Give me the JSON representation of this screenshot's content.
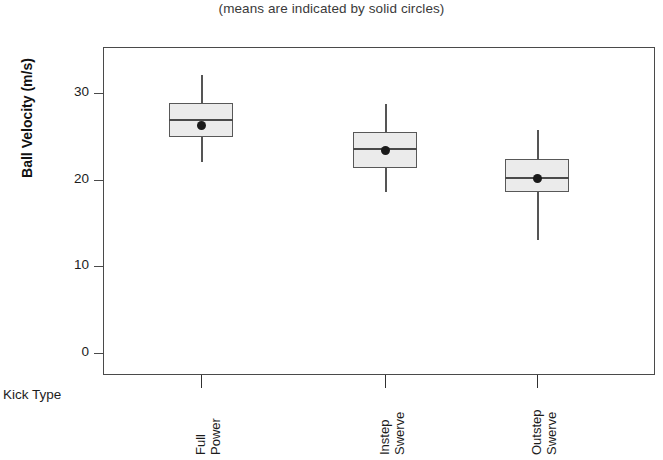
{
  "subtitle": "(means are indicated by solid circles)",
  "axes": {
    "y_title": "Ball Velocity (m/s)",
    "x_title": "Kick Type",
    "y_ticks": [
      "0",
      "10",
      "20",
      "30"
    ]
  },
  "categories": [
    {
      "line1": "Full",
      "line2": "Power"
    },
    {
      "line1": "Instep",
      "line2": "Swerve"
    },
    {
      "line1": "Outstep",
      "line2": "Swerve"
    }
  ],
  "chart_data": {
    "type": "box",
    "title": "",
    "subtitle": "(means are indicated by solid circles)",
    "xlabel": "Kick Type",
    "ylabel": "Ball Velocity (m/s)",
    "ylim": [
      0,
      34.5
    ],
    "yticks": [
      0,
      10,
      20,
      30
    ],
    "grid": false,
    "legend": "none",
    "categories": [
      "Full Power",
      "Instep Swerve",
      "Outstep Swerve"
    ],
    "boxes": [
      {
        "category": "Full Power",
        "whisker_low": 22.0,
        "q1": 24.9,
        "median": 27.0,
        "q3": 28.9,
        "whisker_high": 32.1,
        "mean": 26.2
      },
      {
        "category": "Instep Swerve",
        "whisker_low": 18.6,
        "q1": 21.3,
        "median": 23.7,
        "q3": 25.5,
        "whisker_high": 28.7,
        "mean": 23.4
      },
      {
        "category": "Outstep Swerve",
        "whisker_low": 13.0,
        "q1": 18.6,
        "median": 20.3,
        "q3": 22.4,
        "whisker_high": 25.7,
        "mean": 20.1
      }
    ]
  },
  "colors": {
    "box_fill": "#ebebeb",
    "box_stroke": "#585858",
    "whisker": "#555555",
    "mean_dot": "#1a1a1a",
    "frame": "#4a4a4a"
  }
}
